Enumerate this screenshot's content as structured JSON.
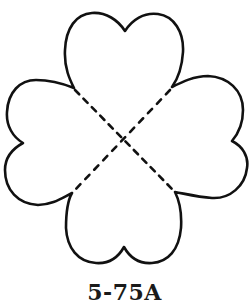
{
  "figure": {
    "shape": "four-leaf-clover-template",
    "outline_color": "#111111",
    "fold_line_style": "dashed",
    "fold_lines": 2
  },
  "caption": {
    "label": "5-75A"
  }
}
